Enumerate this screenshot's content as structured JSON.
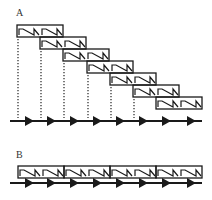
{
  "panels": {
    "a": {
      "label": "A",
      "blocks": [
        {
          "x": 17,
          "y": 25
        },
        {
          "x": 40,
          "y": 37
        },
        {
          "x": 63,
          "y": 49
        },
        {
          "x": 87,
          "y": 61
        },
        {
          "x": 110,
          "y": 73
        },
        {
          "x": 133,
          "y": 85
        },
        {
          "x": 156,
          "y": 97
        }
      ],
      "block_width": 46,
      "block_height": 12,
      "dotted_lines_x": [
        18,
        41,
        64,
        88,
        111,
        134
      ],
      "timeline_y": 121,
      "arrowheads_x": [
        30,
        52,
        75,
        98,
        121,
        144,
        167,
        192
      ]
    },
    "b": {
      "label": "B",
      "blocks": [
        {
          "x": 18,
          "y": 166
        },
        {
          "x": 64,
          "y": 166
        },
        {
          "x": 110,
          "y": 166
        },
        {
          "x": 156,
          "y": 166
        }
      ],
      "block_width": 46,
      "block_height": 12,
      "timeline_y": 183,
      "arrowheads_x": [
        30,
        52,
        75,
        98,
        121,
        144,
        167,
        192
      ]
    }
  },
  "colors": {
    "stroke": "#1a1a1a",
    "dots": "#333333"
  }
}
